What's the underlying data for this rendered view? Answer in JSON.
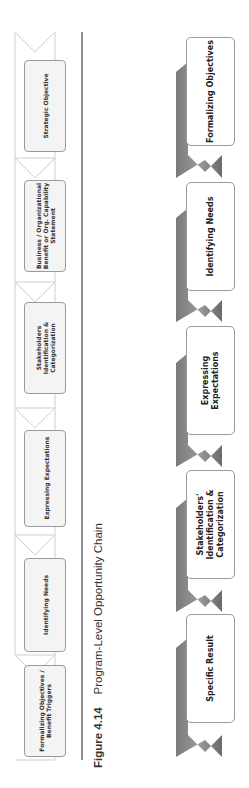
{
  "figure": {
    "number": "Figure 4.14",
    "title": "Program-Level Opportunity Chain"
  },
  "left_chain": {
    "style": "outlined-light",
    "items": [
      {
        "label": "Formalizing Objectives / Benefit Triggers"
      },
      {
        "label": "Identifying Needs"
      },
      {
        "label": "Expressing Expectations"
      },
      {
        "label": "Stakeholders Identification & Categorization"
      },
      {
        "label": "Business / Organizational Benefit or Org. Capability Statement"
      },
      {
        "label": "Strategic Objective"
      }
    ]
  },
  "right_chain": {
    "style": "dark-ribbon",
    "items": [
      {
        "label": "Specific Result"
      },
      {
        "label": "Stakeholders' Identification & Categorization"
      },
      {
        "label": "Expressing Expectations"
      },
      {
        "label": "Identifying Needs"
      },
      {
        "label": "Formalizing Objectives"
      }
    ]
  },
  "colors": {
    "left_outline": "#cfcfcf",
    "box_border": "#9a9a9a",
    "ribbon": "#8a8a8a",
    "ribbon_dark": "#6e6e6e",
    "separator": "#555555"
  }
}
